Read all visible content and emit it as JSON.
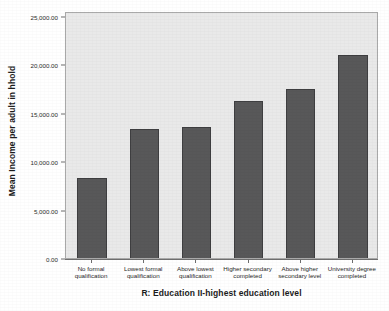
{
  "chart_data": {
    "type": "bar",
    "title": "",
    "subtitle": "",
    "xlabel": "R: Education II-highest education level",
    "ylabel": "Mean Income per adult in hhold",
    "categories": [
      "No formal qualification",
      "Lowest formal qualification",
      "Above lowest qualification",
      "Higher secondary completed",
      "Above higher secondary level",
      "University degree completed"
    ],
    "values": [
      8260,
      13330,
      13530,
      16220,
      17460,
      21000
    ],
    "ylim": [
      0,
      25000
    ],
    "ytick_values": [
      0,
      5000,
      10000,
      15000,
      20000,
      25000
    ],
    "ytick_labels": [
      "0.00",
      "5,000.00",
      "10,000.00",
      "15,000.00",
      "20,000.00",
      "25,000.00"
    ],
    "grid": false,
    "legend": "none",
    "bar_color": "#585859",
    "bar_edge_color": "#3e3e40",
    "plot_background": "#e9e9e9",
    "figure_background": "#ffffff",
    "axis_color": "#707070"
  }
}
